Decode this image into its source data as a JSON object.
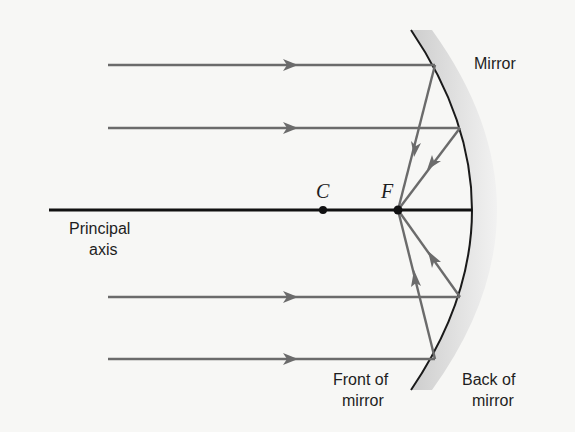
{
  "diagram": {
    "type": "concave-mirror-ray-diagram",
    "labels": {
      "mirror": "Mirror",
      "principal_axis_line1": "Principal",
      "principal_axis_line2": "axis",
      "center_of_curvature": "C",
      "focal_point": "F",
      "front_line1": "Front of",
      "front_line2": "mirror",
      "back_line1": "Back of",
      "back_line2": "mirror"
    },
    "rays": [
      {
        "name": "ray-1",
        "y": 65,
        "reflect_x": 435,
        "direction": "down-to-F"
      },
      {
        "name": "ray-2",
        "y": 128,
        "reflect_x": 460,
        "direction": "down-to-F"
      },
      {
        "name": "ray-3",
        "y": 297,
        "reflect_x": 460,
        "direction": "up-to-F"
      },
      {
        "name": "ray-4",
        "y": 359,
        "reflect_x": 435,
        "direction": "up-to-F"
      }
    ],
    "colors": {
      "ray": "#6b6b6b",
      "axis": "#111111",
      "mirror_line": "#1a1a1a",
      "mirror_shade": "#d9d9d9",
      "background": "#f7f7f5"
    }
  }
}
